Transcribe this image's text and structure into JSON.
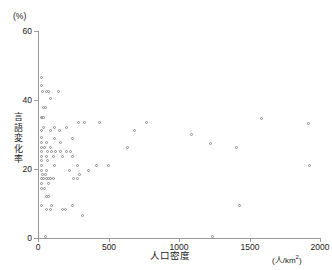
{
  "chart_data": {
    "type": "scatter",
    "title": "",
    "xlabel": "人口密度",
    "xunit": "(人/km2)",
    "ylabel": "言語変化率",
    "yunit": "(%)",
    "xlim": [
      0,
      2000
    ],
    "ylim": [
      0,
      60
    ],
    "xticks": [
      0,
      500,
      1000,
      1500,
      2000
    ],
    "xtick_labels": [
      "0",
      "500",
      "1000",
      "1500",
      "2000"
    ],
    "yticks": [
      0,
      20,
      40,
      60
    ],
    "ytick_labels": [
      "0",
      "20",
      "40",
      "60"
    ],
    "grid": false,
    "legend": "none",
    "marker": "open-circle",
    "marker_color": "#8a8a90",
    "axis_color": "#9a9a9a",
    "points": [
      [
        28,
        46.5
      ],
      [
        30,
        44.0
      ],
      [
        34,
        42.2
      ],
      [
        60,
        42.2
      ],
      [
        80,
        42.2
      ],
      [
        150,
        42.2
      ],
      [
        95,
        40.3
      ],
      [
        42,
        37.8
      ],
      [
        55,
        37.8
      ],
      [
        30,
        34.8
      ],
      [
        38,
        34.8
      ],
      [
        45,
        34.8
      ],
      [
        1590,
        34.4
      ],
      [
        290,
        33.3
      ],
      [
        330,
        33.3
      ],
      [
        440,
        33.3
      ],
      [
        770,
        33.3
      ],
      [
        1920,
        33.1
      ],
      [
        40,
        32.0
      ],
      [
        120,
        32.0
      ],
      [
        205,
        32.0
      ],
      [
        28,
        31.0
      ],
      [
        95,
        31.0
      ],
      [
        155,
        31.0
      ],
      [
        690,
        31.0
      ],
      [
        1090,
        30.0
      ],
      [
        26,
        29.0
      ],
      [
        120,
        28.8
      ],
      [
        250,
        28.8
      ],
      [
        30,
        27.5
      ],
      [
        60,
        27.5
      ],
      [
        165,
        27.5
      ],
      [
        1230,
        27.2
      ],
      [
        26,
        26.0
      ],
      [
        50,
        26.0
      ],
      [
        90,
        26.0
      ],
      [
        640,
        26.0
      ],
      [
        1410,
        26.0
      ],
      [
        30,
        25.0
      ],
      [
        70,
        25.0
      ],
      [
        100,
        25.0
      ],
      [
        130,
        25.0
      ],
      [
        165,
        25.0
      ],
      [
        205,
        25.0
      ],
      [
        235,
        25.0
      ],
      [
        28,
        23.6
      ],
      [
        60,
        23.6
      ],
      [
        110,
        23.6
      ],
      [
        180,
        23.6
      ],
      [
        250,
        23.6
      ],
      [
        30,
        22.3
      ],
      [
        72,
        22.3
      ],
      [
        26,
        21.0
      ],
      [
        120,
        21.0
      ],
      [
        280,
        21.0
      ],
      [
        420,
        21.0
      ],
      [
        500,
        21.0
      ],
      [
        1930,
        20.8
      ],
      [
        30,
        19.5
      ],
      [
        65,
        19.5
      ],
      [
        230,
        19.5
      ],
      [
        360,
        19.5
      ],
      [
        33,
        18.2
      ],
      [
        55,
        18.2
      ],
      [
        300,
        18.2
      ],
      [
        28,
        17.0
      ],
      [
        44,
        17.0
      ],
      [
        60,
        17.0
      ],
      [
        78,
        17.0
      ],
      [
        95,
        17.0
      ],
      [
        110,
        17.0
      ],
      [
        255,
        17.0
      ],
      [
        285,
        17.0
      ],
      [
        26,
        15.6
      ],
      [
        75,
        15.6
      ],
      [
        30,
        14.2
      ],
      [
        50,
        14.2
      ],
      [
        60,
        12.0
      ],
      [
        80,
        12.0
      ],
      [
        30,
        9.4
      ],
      [
        100,
        9.4
      ],
      [
        250,
        9.4
      ],
      [
        1430,
        9.2
      ],
      [
        60,
        8.0
      ],
      [
        90,
        8.0
      ],
      [
        175,
        8.0
      ],
      [
        195,
        8.0
      ],
      [
        320,
        6.5
      ],
      [
        55,
        0.4
      ],
      [
        1240,
        0.4
      ]
    ]
  }
}
